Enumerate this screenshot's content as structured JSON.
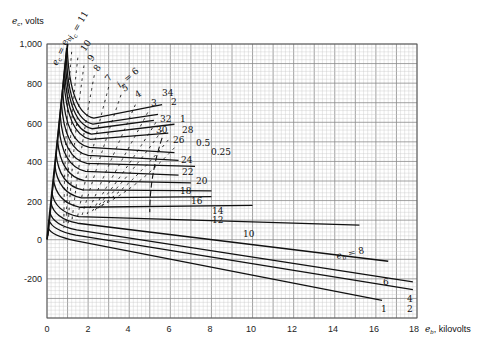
{
  "chart_data": {
    "type": "line",
    "title": "",
    "xlabel": "e_b, kilovolts",
    "ylabel": "e_c, volts",
    "xlim": [
      0,
      18
    ],
    "ylim": [
      -400,
      1000
    ],
    "grid": true,
    "x_ticks": [
      "0",
      "2",
      "4",
      "6",
      "8",
      "10",
      "12",
      "14",
      "16",
      "18"
    ],
    "y_ticks": [
      "1,000",
      "800",
      "600",
      "400",
      "200",
      "0",
      "-200"
    ],
    "boundary_line_label": "e_c = e_b",
    "plate_current_label_prefix": "i_b =",
    "grid_current_label_prefix": "i_c =",
    "plate_current_curves": [
      {
        "name": "34",
        "label_at": [
          5.6,
          680
        ]
      },
      {
        "name": "32",
        "label_at": [
          5.2,
          630
        ]
      },
      {
        "name": "30",
        "label_at": [
          5.0,
          600
        ]
      },
      {
        "name": "28",
        "label_at": [
          6.3,
          585
        ]
      },
      {
        "name": "26",
        "label_at": [
          5.9,
          540
        ]
      },
      {
        "name": "24",
        "label_at": [
          6.3,
          440
        ]
      },
      {
        "name": "22",
        "label_at": [
          6.5,
          400
        ]
      },
      {
        "name": "20",
        "label_at": [
          7.5,
          370
        ]
      },
      {
        "name": "18",
        "label_at": [
          6.5,
          320
        ]
      },
      {
        "name": "16",
        "label_at": [
          7.0,
          285
        ]
      },
      {
        "name": "14",
        "label_at": [
          8.0,
          245
        ]
      },
      {
        "name": "12",
        "label_at": [
          8.0,
          215
        ]
      },
      {
        "name": "10",
        "label_at": [
          10.0,
          170
        ]
      },
      {
        "name": "8",
        "label_at": [
          14.5,
          75
        ]
      },
      {
        "name": "6",
        "label_at": [
          16.5,
          -110
        ]
      },
      {
        "name": "4",
        "label_at": [
          17.9,
          -220
        ]
      },
      {
        "name": "2",
        "label_at": [
          17.9,
          -265
        ]
      },
      {
        "name": "1",
        "label_at": [
          16.3,
          -320
        ]
      },
      {
        "name": "0.5",
        "label_at": [
          7.0,
          505
        ]
      },
      {
        "name": "0.25",
        "label_at": [
          7.9,
          465
        ]
      }
    ],
    "grid_current_curves": [
      {
        "name": "11"
      },
      {
        "name": "10"
      },
      {
        "name": "9"
      },
      {
        "name": "8"
      },
      {
        "name": "7"
      },
      {
        "name": "6"
      },
      {
        "name": "5"
      },
      {
        "name": "4"
      },
      {
        "name": "3"
      },
      {
        "name": "2"
      },
      {
        "name": "1"
      },
      {
        "name": "0.5"
      },
      {
        "name": "0.25"
      }
    ]
  },
  "labels": {
    "y_axis": "e",
    "y_axis_sub": "c",
    "y_axis_unit": ", volts",
    "x_axis": "e",
    "x_axis_sub": "b",
    "x_axis_unit": ", kilovolts",
    "ic_eq_11": "i",
    "ic_sub": "c",
    "ic_11_val": " = 11",
    "ic_6_val": " = 6",
    "ib_sub": "b",
    "ib_8_val": " = 8",
    "ec_eb": "e",
    "ec_eb_rest": " = e",
    "ic_labels": [
      "10",
      "9",
      "8",
      "7",
      "5",
      "4",
      "3",
      "2",
      "1",
      "0.5",
      "0.25"
    ],
    "ib_labels": [
      "34",
      "32",
      "30",
      "28",
      "26",
      "24",
      "22",
      "20",
      "18",
      "16",
      "14",
      "12",
      "10",
      "6",
      "4",
      "2",
      "1"
    ]
  }
}
